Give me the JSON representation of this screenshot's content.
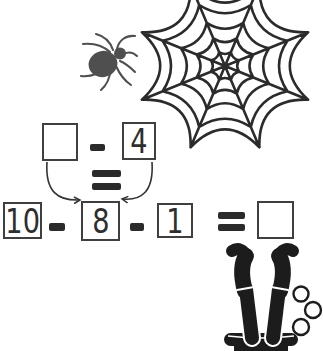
{
  "puzzle": {
    "top_equation": {
      "minuend_value": "",
      "operator": "-",
      "subtrahend_value": "4",
      "equals": "="
    },
    "bottom_equation": {
      "term1": "10",
      "operator1": "-",
      "term2": "8",
      "operator2": "-",
      "term3": "1",
      "equals": "=",
      "answer_value": ""
    }
  },
  "decorations": {
    "spider": {
      "color": "#4f4f4f"
    },
    "spider_web": {
      "color": "#2b2b2b"
    },
    "witch_in_cauldron": {
      "color": "#1c1c1c",
      "bubble_count": 3
    }
  },
  "colors": {
    "background": "#ffffff",
    "ink": "#2b2b2b",
    "box_border": "#3f3f3f"
  }
}
